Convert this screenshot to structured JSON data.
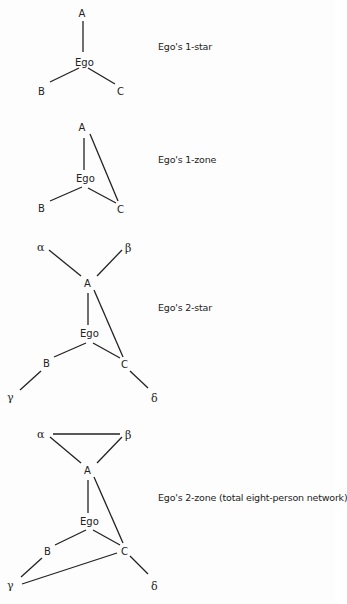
{
  "figure": {
    "panels": [
      {
        "id": "one-star",
        "caption": "Ego's 1-star",
        "nodes": {
          "A": "A",
          "Ego": "Ego",
          "B": "B",
          "C": "C"
        },
        "edges": [
          [
            "A",
            "Ego"
          ],
          [
            "Ego",
            "B"
          ],
          [
            "Ego",
            "C"
          ]
        ]
      },
      {
        "id": "one-zone",
        "caption": "Ego's 1-zone",
        "nodes": {
          "A": "A",
          "Ego": "Ego",
          "B": "B",
          "C": "C"
        },
        "edges": [
          [
            "A",
            "Ego"
          ],
          [
            "A",
            "C"
          ],
          [
            "Ego",
            "B"
          ],
          [
            "Ego",
            "C"
          ]
        ]
      },
      {
        "id": "two-star",
        "caption": "Ego's 2-star",
        "nodes": {
          "alpha": "α",
          "beta": "β",
          "A": "A",
          "Ego": "Ego",
          "B": "B",
          "C": "C",
          "gamma": "γ",
          "delta": "δ"
        },
        "edges": [
          [
            "alpha",
            "A"
          ],
          [
            "beta",
            "A"
          ],
          [
            "A",
            "Ego"
          ],
          [
            "A",
            "C"
          ],
          [
            "Ego",
            "B"
          ],
          [
            "Ego",
            "C"
          ],
          [
            "B",
            "gamma"
          ],
          [
            "C",
            "delta"
          ]
        ]
      },
      {
        "id": "two-zone",
        "caption": "Ego's 2-zone (total eight-person network)",
        "nodes": {
          "alpha": "α",
          "beta": "β",
          "A": "A",
          "Ego": "Ego",
          "B": "B",
          "C": "C",
          "gamma": "γ",
          "delta": "δ"
        },
        "edges": [
          [
            "alpha",
            "beta"
          ],
          [
            "alpha",
            "A"
          ],
          [
            "beta",
            "A"
          ],
          [
            "A",
            "Ego"
          ],
          [
            "A",
            "C"
          ],
          [
            "Ego",
            "B"
          ],
          [
            "Ego",
            "C"
          ],
          [
            "B",
            "gamma"
          ],
          [
            "C",
            "gamma"
          ],
          [
            "C",
            "delta"
          ]
        ]
      }
    ]
  }
}
